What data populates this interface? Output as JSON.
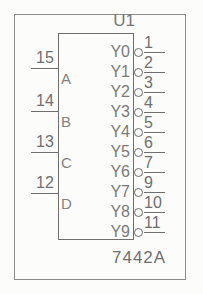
{
  "diagram": {
    "title": "U1",
    "reference_designator": "U1",
    "part_number": "7442A",
    "body": {
      "x": 58,
      "y": 33,
      "width": 76,
      "height": 207
    },
    "frame": {
      "x": 14,
      "y": 14,
      "width": 172,
      "height": 266
    },
    "colors": {
      "line": "#6e6e6e",
      "frame": "#8d8d8d",
      "text": "#6f6f6f",
      "background": "#fcfcfb"
    },
    "inputs": [
      {
        "pin": "15",
        "label": "A",
        "y": 68
      },
      {
        "pin": "14",
        "label": "B",
        "y": 111
      },
      {
        "pin": "13",
        "label": "C",
        "y": 152
      },
      {
        "pin": "12",
        "label": "D",
        "y": 193
      }
    ],
    "outputs": [
      {
        "pin": "1",
        "label": "Y0",
        "y": 52,
        "inverted": true
      },
      {
        "pin": "2",
        "label": "Y1",
        "y": 72,
        "inverted": true
      },
      {
        "pin": "3",
        "label": "Y2",
        "y": 92,
        "inverted": true
      },
      {
        "pin": "4",
        "label": "Y3",
        "y": 112,
        "inverted": true
      },
      {
        "pin": "5",
        "label": "Y4",
        "y": 132,
        "inverted": true
      },
      {
        "pin": "6",
        "label": "Y5",
        "y": 152,
        "inverted": true
      },
      {
        "pin": "7",
        "label": "Y6",
        "y": 172,
        "inverted": true
      },
      {
        "pin": "9",
        "label": "Y7",
        "y": 192,
        "inverted": true
      },
      {
        "pin": "10",
        "label": "Y8",
        "y": 212,
        "inverted": true
      },
      {
        "pin": "11",
        "label": "Y9",
        "y": 232,
        "inverted": true
      }
    ]
  }
}
